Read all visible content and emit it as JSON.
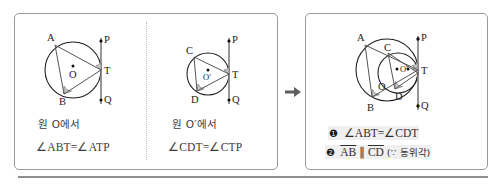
{
  "figure": {
    "panels": {
      "left": {
        "sub_figures": [
          {
            "caption_line1": "원 O에서",
            "caption_line2": "∠ABT=∠ATP",
            "circle_label": "O",
            "points": [
              "A",
              "B",
              "T",
              "P",
              "Q"
            ]
          },
          {
            "caption_line1": "원 O′에서",
            "caption_line2": "∠CDT=∠CTP",
            "circle_label": "O′",
            "points": [
              "C",
              "D",
              "T",
              "P",
              "Q"
            ]
          }
        ]
      },
      "right": {
        "conclusions": [
          {
            "bullet": "❶",
            "text": "∠ABT=∠CDT"
          },
          {
            "bullet": "❷",
            "text_ab": "AB",
            "parallel": "∥",
            "text_cd": "CD",
            "reason": "(∵ 동위각)"
          }
        ],
        "circle_labels": [
          "O",
          "O′"
        ],
        "points": [
          "A",
          "B",
          "C",
          "D",
          "T",
          "P",
          "Q"
        ]
      }
    },
    "arrow": "→",
    "colors": {
      "panel_border": "#9a9a9a",
      "circle_stroke": "#1d1d1d",
      "tangent_stroke": "#7d7d7d",
      "angle_fill": "#c9c9c9",
      "highlight_bg": "#f0f0f0"
    }
  }
}
